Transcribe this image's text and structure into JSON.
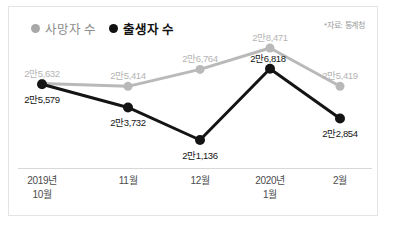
{
  "legend": {
    "items": [
      {
        "label": "사망자 수",
        "color": "#a8a8a8",
        "series_key": "deaths"
      },
      {
        "label": "출생자 수",
        "color": "#111111",
        "series_key": "births"
      }
    ]
  },
  "source_note": "*자료: 통계청",
  "chart_data": {
    "type": "line",
    "title": "",
    "xlabel": "",
    "ylabel": "",
    "grid": false,
    "legend_position": "top-left",
    "categories": [
      "2019년\n10월",
      "11월",
      "12월",
      "2020년\n1월",
      "2월"
    ],
    "category_lines": [
      [
        "2019년",
        "10월"
      ],
      [
        "11월",
        ""
      ],
      [
        "12월",
        ""
      ],
      [
        "2020년",
        "1월"
      ],
      [
        "2월",
        ""
      ]
    ],
    "series": [
      {
        "name": "사망자 수",
        "color": "#a8a8a8",
        "values": [
          25632,
          25414,
          26764,
          28471,
          25419
        ],
        "value_labels": [
          "2만5,632",
          "2만5,414",
          "2만6,764",
          "2만8,471",
          "2만5,419"
        ]
      },
      {
        "name": "출생자 수",
        "color": "#111111",
        "values": [
          25579,
          23732,
          21136,
          26818,
          22854
        ],
        "value_labels": [
          "2만5,579",
          "2만3,732",
          "2만1,136",
          "2만6,818",
          "2만2,854"
        ]
      }
    ],
    "ylim": [
      20000,
      29500
    ]
  }
}
